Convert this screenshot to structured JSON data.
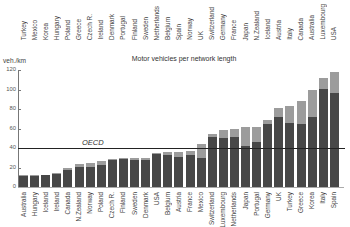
{
  "chart_data": {
    "type": "bar",
    "title": "Motor vehicles per network length",
    "ylabel": "veh./km",
    "xlabel": "",
    "ylim": [
      0,
      120
    ],
    "yticks": [
      0,
      20,
      40,
      60,
      80,
      100,
      120
    ],
    "grid": false,
    "stacked": true,
    "categories": [
      "Australia",
      "Hungary",
      "Iceland",
      "Ireland",
      "Canada",
      "N.Zealand",
      "Norway",
      "Poland",
      "Czech R.",
      "Finland",
      "Sweden",
      "Denmark",
      "USA",
      "Belgium",
      "Austria",
      "France",
      "Mexico",
      "Switzerland",
      "Luxembourg",
      "Netherlands",
      "Japan",
      "Portugal",
      "Germany",
      "UK",
      "Turkey",
      "Greece",
      "Korea",
      "Italy",
      "Spain"
    ],
    "series": [
      {
        "name": "dark segment",
        "color": "#474747",
        "values": [
          11,
          11,
          12,
          13,
          17,
          20,
          21,
          23,
          28,
          29,
          28,
          28,
          34,
          33,
          31,
          33,
          30,
          51,
          50,
          51,
          42,
          46,
          65,
          72,
          66,
          65,
          72,
          101,
          96
        ]
      },
      {
        "name": "total",
        "color": "#9c9c9c",
        "values": [
          12,
          12,
          12,
          14,
          20,
          24,
          25,
          27,
          29,
          30,
          30,
          30,
          35,
          36,
          36,
          37,
          44,
          54,
          58,
          60,
          62,
          62,
          69,
          81,
          83,
          88,
          99,
          112,
          118
        ]
      }
    ],
    "annotations": [
      {
        "type": "hline",
        "value": 40,
        "label": "OECD"
      }
    ],
    "secondary_axis_labels_top": [
      "Turkey",
      "Mexico",
      "Korea",
      "Hungary",
      "Poland",
      "Greece",
      "Czech R.",
      "Ireland",
      "Denmark",
      "Portugal",
      "Finland",
      "Sweden",
      "Netherlands",
      "Belgium",
      "Spain",
      "Norway",
      "UK",
      "Switzerland",
      "Germany",
      "France",
      "Japan",
      "N.Zealand",
      "Iceland",
      "Austria",
      "Italy",
      "Canada",
      "Australia",
      "Luxembourg",
      "USA"
    ]
  },
  "labels": {
    "title": "Motor vehicles per network length",
    "unit": "veh./km",
    "oecd": "OECD",
    "yticks": [
      "0",
      "20",
      "40",
      "60",
      "80",
      "100",
      "120"
    ]
  }
}
